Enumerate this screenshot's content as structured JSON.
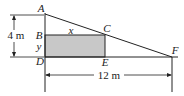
{
  "diagram": {
    "points": {
      "A": "A",
      "B": "B",
      "C": "C",
      "D": "D",
      "E": "E",
      "F": "F"
    },
    "variables": {
      "x": "x",
      "y": "y"
    },
    "dimensions": {
      "height": "4 m",
      "base": "12 m"
    },
    "colors": {
      "rect_fill": "#c8c8c8",
      "line": "#222222"
    }
  }
}
